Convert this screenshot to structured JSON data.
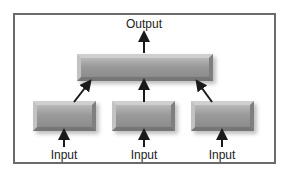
{
  "diagram": {
    "output_label": "Output",
    "input_labels": [
      "Input",
      "Input",
      "Input"
    ],
    "nodes": {
      "top": "aggregation-block",
      "bottom": [
        "input-block-1",
        "input-block-2",
        "input-block-3"
      ]
    },
    "colors": {
      "frame": "#6b6b6b",
      "block": "#9a9a9a",
      "arrow": "#1a1a1a",
      "text": "#222222"
    }
  }
}
